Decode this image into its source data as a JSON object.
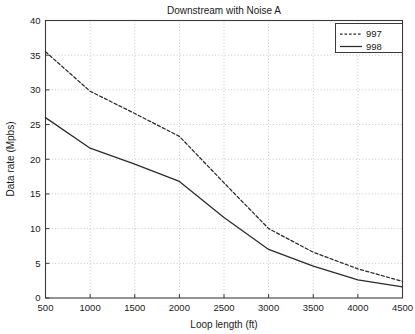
{
  "chart_data": {
    "type": "line",
    "title": "Downstream with Noise A",
    "xlabel": "Loop length (ft)",
    "ylabel": "Data rate (Mpbs)",
    "xlim": [
      500,
      4500
    ],
    "ylim": [
      0,
      40
    ],
    "grid": true,
    "legend_position": "upper right",
    "xticks": [
      500,
      1000,
      1500,
      2000,
      2500,
      3000,
      3500,
      4000,
      4500
    ],
    "yticks": [
      0,
      5,
      10,
      15,
      20,
      25,
      30,
      35,
      40
    ],
    "xtick_labels": [
      "500",
      "1000",
      "1500",
      "2000",
      "2500",
      "3000",
      "3500",
      "4000",
      "4500"
    ],
    "ytick_labels": [
      "0",
      "5",
      "10",
      "15",
      "20",
      "25",
      "30",
      "35",
      "40"
    ],
    "x": [
      500,
      1000,
      1500,
      2000,
      2500,
      3000,
      3500,
      4000,
      4500
    ],
    "series": [
      {
        "name": "997",
        "style": "dashed",
        "color": "#2b2b2b",
        "values": [
          35.5,
          29.8,
          26.6,
          23.3,
          16.6,
          10.0,
          6.6,
          4.2,
          2.4
        ]
      },
      {
        "name": "998",
        "style": "solid",
        "color": "#2b2b2b",
        "values": [
          26.0,
          21.6,
          19.3,
          16.8,
          11.6,
          7.0,
          4.6,
          2.6,
          1.6
        ]
      }
    ],
    "legend": [
      {
        "label": "997",
        "style": "dashed"
      },
      {
        "label": "998",
        "style": "solid"
      }
    ]
  }
}
